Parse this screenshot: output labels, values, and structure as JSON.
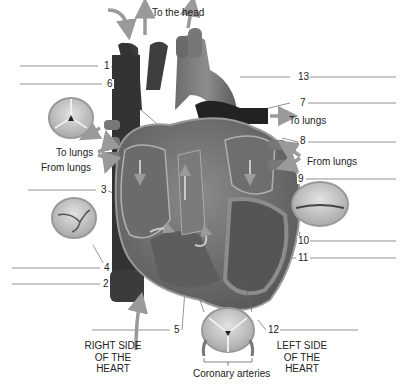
{
  "flow_labels": {
    "to_head": "To the head",
    "to_lungs_right": "To lungs",
    "to_lungs_left": "To lungs",
    "from_lungs_left": "From lungs",
    "from_lungs_right": "From lungs"
  },
  "side_labels": {
    "right": [
      "RIGHT SIDE",
      "OF THE",
      "HEART"
    ],
    "left": [
      "LEFT SIDE",
      "OF THE",
      "HEART"
    ]
  },
  "caption_bottom": "Coronary arteries",
  "numbered_labels": [
    {
      "n": "1",
      "x": 100,
      "y": 63,
      "line_from": 0,
      "line_to": 100
    },
    {
      "n": "6",
      "x": 104,
      "y": 81,
      "line_from": 0,
      "line_to": 104
    },
    {
      "n": "13",
      "x": 298,
      "y": 73,
      "line_from": 290,
      "line_to": 396
    },
    {
      "n": "7",
      "x": 298,
      "y": 99,
      "line_from": 290,
      "line_to": 396
    },
    {
      "n": "8",
      "x": 300,
      "y": 138,
      "line_from": 300,
      "line_to": 396
    },
    {
      "n": "9",
      "x": 297,
      "y": 175,
      "line_from": 297,
      "line_to": 396
    },
    {
      "n": "3",
      "x": 98,
      "y": 186,
      "line_from": 0,
      "line_to": 98
    },
    {
      "n": "10",
      "x": 298,
      "y": 238,
      "line_from": 298,
      "line_to": 396
    },
    {
      "n": "11",
      "x": 298,
      "y": 255,
      "line_from": 298,
      "line_to": 396
    },
    {
      "n": "4",
      "x": 102,
      "y": 265,
      "line_from": 0,
      "line_to": 102
    },
    {
      "n": "2",
      "x": 102,
      "y": 280,
      "line_from": 0,
      "line_to": 102
    },
    {
      "n": "5",
      "x": 173,
      "y": 327,
      "line_from": 92,
      "line_to": 173
    },
    {
      "n": "12",
      "x": 267,
      "y": 327,
      "line_from": 267,
      "line_to": 358
    }
  ],
  "colors": {
    "background": "#ffffff",
    "heart_wall": "#7a7a7a",
    "chamber": "#5a5a5a",
    "vessel_dark": "#2e2e2e",
    "arrow": "#9a9a9a",
    "leader_line": "#555555",
    "valve_fill": "#c8c8c8"
  }
}
